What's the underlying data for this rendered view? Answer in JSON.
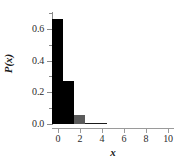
{
  "chart_data": {
    "type": "bar",
    "title": "",
    "subtitle": "",
    "xlabel": "x",
    "ylabel": "P(x)",
    "categories": [
      0,
      1,
      2,
      3,
      4,
      5,
      6,
      7,
      8,
      9,
      10
    ],
    "values": [
      0.665,
      0.272,
      0.055,
      0.007,
      0.001,
      0.0,
      0.0,
      0.0,
      0.0,
      0.0,
      0.0
    ],
    "series": [
      {
        "name": "P(x)",
        "values": [
          0.665,
          0.272,
          0.055,
          0.007,
          0.001,
          0.0,
          0.0,
          0.0,
          0.0,
          0.0,
          0.0
        ]
      }
    ],
    "bar_colors": [
      "#000000",
      "#000000",
      "#5a5a5a",
      "#1a1a1a",
      "#1a1a1a",
      "#1a1a1a",
      "#1a1a1a",
      "#1a1a1a",
      "#1a1a1a",
      "#1a1a1a",
      "#1a1a1a"
    ],
    "bar_width": 1.0,
    "xlim": [
      -0.5,
      10.5
    ],
    "ylim": [
      0.0,
      0.7
    ],
    "grid": false,
    "legend": false,
    "legend_position": "none",
    "y_ticks": [
      {
        "value": 0.0,
        "label": "0.0",
        "major": true
      },
      {
        "value": 0.1,
        "label": "",
        "major": false
      },
      {
        "value": 0.2,
        "label": "0.2",
        "major": true
      },
      {
        "value": 0.3,
        "label": "",
        "major": false
      },
      {
        "value": 0.4,
        "label": "0.4",
        "major": true
      },
      {
        "value": 0.5,
        "label": "",
        "major": false
      },
      {
        "value": 0.6,
        "label": "0.6",
        "major": true
      },
      {
        "value": 0.7,
        "label": "",
        "major": false
      }
    ],
    "x_ticks": [
      {
        "value": 0,
        "label": "0"
      },
      {
        "value": 2,
        "label": "2"
      },
      {
        "value": 4,
        "label": "4"
      },
      {
        "value": 6,
        "label": "6"
      },
      {
        "value": 8,
        "label": "8"
      },
      {
        "value": 10,
        "label": "10"
      }
    ],
    "axis_color": "#8a8a8a",
    "text_color": "#2b2b2b",
    "background": "#ffffff"
  }
}
